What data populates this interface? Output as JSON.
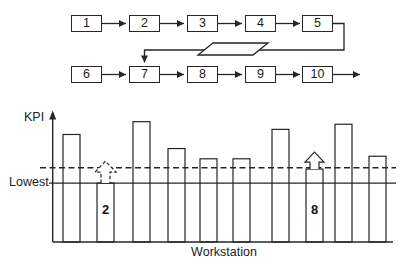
{
  "flowchart": {
    "top_row_boxes": [
      "1",
      "2",
      "3",
      "4",
      "5"
    ],
    "bottom_row_boxes": [
      "6",
      "7",
      "8",
      "9",
      "10"
    ]
  },
  "chart": {
    "y_axis_label": "KPI",
    "x_axis_label": "Workstation",
    "reference_line_label": "Lowest"
  },
  "chart_data": {
    "type": "bar",
    "xlabel": "Workstation",
    "ylabel": "KPI",
    "categories": [
      "1",
      "2",
      "3",
      "4",
      "5",
      "6",
      "7",
      "8",
      "9",
      "10"
    ],
    "values": [
      84,
      46,
      94,
      73,
      65,
      65,
      88,
      57,
      92,
      67
    ],
    "ylim": [
      0,
      100
    ],
    "grid": false,
    "bar_fill": "none",
    "line_color": "#262626",
    "reference_lines": [
      {
        "label": "Lowest",
        "value": 46,
        "style": "solid"
      },
      {
        "label": "",
        "value": 58,
        "style": "dashed"
      }
    ],
    "annotations": [
      {
        "category": "2",
        "label": "2",
        "arrow_style": "dashed"
      },
      {
        "category": "8",
        "label": "8",
        "arrow_style": "solid"
      }
    ]
  }
}
